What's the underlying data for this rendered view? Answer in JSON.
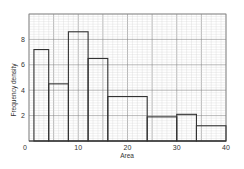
{
  "chart_data": {
    "type": "bar",
    "subtype": "histogram",
    "title": "",
    "xlabel": "Area",
    "ylabel": "Frequency density",
    "xlim": [
      0,
      40
    ],
    "ylim": [
      0,
      10
    ],
    "x_ticks": [
      0,
      10,
      20,
      30,
      40
    ],
    "y_ticks": [
      2,
      4,
      6,
      8
    ],
    "grid": true,
    "legend": null,
    "bins": [
      {
        "from": 1,
        "to": 4,
        "frequency_density": 7.2
      },
      {
        "from": 4,
        "to": 8,
        "frequency_density": 4.5
      },
      {
        "from": 8,
        "to": 12,
        "frequency_density": 8.6
      },
      {
        "from": 12,
        "to": 16,
        "frequency_density": 6.5
      },
      {
        "from": 16,
        "to": 24,
        "frequency_density": 3.5
      },
      {
        "from": 24,
        "to": 30,
        "frequency_density": 1.9
      },
      {
        "from": 30,
        "to": 34,
        "frequency_density": 2.1
      },
      {
        "from": 34,
        "to": 40,
        "frequency_density": 1.2
      }
    ],
    "categories": [
      "1-4",
      "4-8",
      "8-12",
      "12-16",
      "16-24",
      "24-30",
      "30-34",
      "34-40"
    ],
    "values": [
      7.2,
      4.5,
      8.6,
      6.5,
      3.5,
      1.9,
      2.1,
      1.2
    ]
  },
  "colors": {
    "grid_major": "#8a8a8a",
    "grid_minor": "#d4d4d4",
    "bar_outline": "#333333",
    "background": "#ffffff"
  }
}
